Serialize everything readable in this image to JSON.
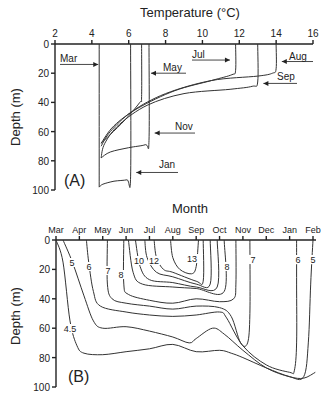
{
  "chart_data": [
    {
      "panel": "A",
      "type": "line",
      "title": "Temperature (°C)",
      "xlabel": "Temperature (°C)",
      "ylabel": "Depth (m)",
      "xlim": [
        2,
        16
      ],
      "ylim": [
        0,
        100
      ],
      "x_ticks": [
        2,
        4,
        6,
        8,
        10,
        12,
        14,
        16
      ],
      "y_ticks": [
        0,
        20,
        40,
        60,
        80,
        100
      ],
      "y_inverted": true,
      "x_axis_position": "top",
      "panel_label": "(A)",
      "series": [
        {
          "name": "Mar",
          "points": [
            [
              4.4,
              0
            ],
            [
              4.4,
              98
            ]
          ]
        },
        {
          "name": "May",
          "points": [
            [
              6.7,
              0
            ],
            [
              6.7,
              36
            ],
            [
              6.6,
              40
            ],
            [
              5.8,
              52
            ],
            [
              5.0,
              62
            ],
            [
              4.5,
              68
            ]
          ]
        },
        {
          "name": "Jul",
          "points": [
            [
              11.8,
              0
            ],
            [
              11.8,
              18
            ],
            [
              11.6,
              21
            ],
            [
              10.5,
              25
            ],
            [
              8.5,
              32
            ],
            [
              6.5,
              44
            ],
            [
              5.2,
              56
            ],
            [
              4.5,
              68
            ]
          ]
        },
        {
          "name": "Aug",
          "points": [
            [
              14.0,
              0
            ],
            [
              14.0,
              17
            ],
            [
              13.8,
              20
            ],
            [
              13.0,
              22
            ],
            [
              10.5,
              25
            ],
            [
              8.0,
              34
            ],
            [
              6.2,
              46
            ],
            [
              5.0,
              60
            ],
            [
              4.5,
              70
            ]
          ]
        },
        {
          "name": "Sep",
          "points": [
            [
              13.0,
              0
            ],
            [
              13.0,
              26
            ],
            [
              12.7,
              29
            ],
            [
              11.5,
              31
            ],
            [
              9.0,
              34
            ],
            [
              7.0,
              42
            ],
            [
              5.5,
              55
            ],
            [
              4.7,
              68
            ],
            [
              4.5,
              78
            ]
          ]
        },
        {
          "name": "Nov",
          "points": [
            [
              7.1,
              0
            ],
            [
              7.1,
              66
            ],
            [
              6.9,
              69
            ],
            [
              6.0,
              71
            ],
            [
              5.0,
              74
            ],
            [
              4.5,
              78
            ]
          ]
        },
        {
          "name": "Jan",
          "points": [
            [
              6.1,
              0
            ],
            [
              6.1,
              91
            ],
            [
              5.9,
              93
            ],
            [
              5.2,
              94
            ],
            [
              4.6,
              96
            ],
            [
              4.4,
              98
            ]
          ]
        }
      ],
      "annotations": [
        {
          "text": "Mar",
          "arrow_to": [
            4.4,
            14
          ]
        },
        {
          "text": "May",
          "arrow_to": [
            7.1,
            20
          ]
        },
        {
          "text": "Jul",
          "arrow_to": [
            11.6,
            11
          ]
        },
        {
          "text": "Aug",
          "arrow_to": [
            14.2,
            12
          ]
        },
        {
          "text": "Sep",
          "arrow_to": [
            13.2,
            27
          ]
        },
        {
          "text": "Nov",
          "arrow_to": [
            7.3,
            61
          ]
        },
        {
          "text": "Jan",
          "arrow_to": [
            6.3,
            88
          ]
        }
      ]
    },
    {
      "panel": "B",
      "type": "line",
      "title": "Month",
      "xlabel": "Month",
      "ylabel": "Depth (m)",
      "categories": [
        "Mar",
        "Apr",
        "May",
        "Jun",
        "Jul",
        "Aug",
        "Sep",
        "Oct",
        "Nov",
        "Dec",
        "Jan",
        "Feb"
      ],
      "ylim": [
        0,
        100
      ],
      "y_ticks": [
        0,
        20,
        40,
        60,
        80,
        100
      ],
      "y_inverted": true,
      "x_axis_position": "top",
      "panel_label": "(B)",
      "isotherm_labels": [
        "4.5",
        "5",
        "6",
        "7",
        "8",
        "10",
        "12",
        "13",
        "8",
        "7",
        "6",
        "5"
      ],
      "series": [
        {
          "name": "4.5",
          "points": [
            [
              0.0,
              0
            ],
            [
              0.3,
              15
            ],
            [
              0.6,
              55
            ],
            [
              0.9,
              72
            ],
            [
              1.2,
              77
            ],
            [
              2,
              78
            ],
            [
              3,
              76
            ],
            [
              4,
              74
            ],
            [
              5,
              71
            ],
            [
              6,
              76
            ],
            [
              7,
              75
            ],
            [
              7.5,
              77
            ],
            [
              8,
              80
            ],
            [
              9,
              87
            ],
            [
              10,
              93
            ],
            [
              10.6,
              94
            ],
            [
              11.1,
              90
            ]
          ]
        },
        {
          "name": "5",
          "points": [
            [
              0.3,
              0
            ],
            [
              0.7,
              15
            ],
            [
              1.2,
              38
            ],
            [
              1.6,
              55
            ],
            [
              2,
              60
            ],
            [
              3,
              59
            ],
            [
              4,
              62
            ],
            [
              5,
              66
            ],
            [
              5.7,
              70
            ],
            [
              6,
              67
            ],
            [
              6.7,
              60
            ],
            [
              7.2,
              64
            ],
            [
              8,
              75
            ],
            [
              9,
              87
            ],
            [
              10,
              93
            ],
            [
              10.6,
              93
            ],
            [
              10.8,
              70
            ],
            [
              10.9,
              30
            ],
            [
              11,
              0
            ]
          ]
        },
        {
          "name": "6",
          "points": [
            [
              1.3,
              0
            ],
            [
              1.4,
              15
            ],
            [
              1.6,
              35
            ],
            [
              1.9,
              45
            ],
            [
              3,
              49
            ],
            [
              4,
              51
            ],
            [
              5,
              52
            ],
            [
              6,
              51
            ],
            [
              7,
              49
            ],
            [
              7.3,
              53
            ],
            [
              8,
              72
            ],
            [
              9,
              85
            ],
            [
              10,
              90
            ],
            [
              10.2,
              89
            ],
            [
              10.3,
              70
            ],
            [
              10.3,
              30
            ],
            [
              10.3,
              0
            ]
          ]
        },
        {
          "name": "7",
          "points": [
            [
              2.2,
              0
            ],
            [
              2.2,
              30
            ],
            [
              2.4,
              40
            ],
            [
              3,
              43
            ],
            [
              4,
              45
            ],
            [
              5,
              47
            ],
            [
              6,
              45
            ],
            [
              7,
              46
            ],
            [
              7.5,
              52
            ],
            [
              7.9,
              70
            ],
            [
              8.2,
              70
            ],
            [
              8.3,
              50
            ],
            [
              8.3,
              0
            ]
          ]
        },
        {
          "name": "8",
          "points": [
            [
              2.9,
              0
            ],
            [
              2.9,
              30
            ],
            [
              3.1,
              37
            ],
            [
              4,
              41
            ],
            [
              5,
              43
            ],
            [
              6,
              40
            ],
            [
              7,
              42
            ],
            [
              7.6,
              40
            ],
            [
              7.7,
              30
            ],
            [
              7.7,
              0
            ]
          ]
        },
        {
          "name": "10",
          "points": [
            [
              3.1,
              0
            ],
            [
              3.3,
              22
            ],
            [
              3.7,
              30
            ],
            [
              5,
              32
            ],
            [
              6,
              33
            ],
            [
              7.2,
              35
            ],
            [
              7.2,
              0
            ]
          ]
        },
        {
          "name": "10b",
          "points": [
            [
              3.4,
              0
            ],
            [
              3.6,
              18
            ],
            [
              4,
              27
            ],
            [
              5,
              29
            ],
            [
              6,
              32
            ],
            [
              6.9,
              32
            ],
            [
              6.9,
              0
            ]
          ]
        },
        {
          "name": "12",
          "points": [
            [
              3.8,
              0
            ],
            [
              3.9,
              12
            ],
            [
              4.3,
              22
            ],
            [
              5,
              25
            ],
            [
              6,
              30
            ],
            [
              6.6,
              30
            ],
            [
              6.6,
              0
            ]
          ]
        },
        {
          "name": "12b",
          "points": [
            [
              4.2,
              0
            ],
            [
              4.3,
              12
            ],
            [
              4.6,
              20
            ],
            [
              5,
              22
            ],
            [
              6,
              28
            ],
            [
              6.3,
              28
            ],
            [
              6.3,
              0
            ]
          ]
        },
        {
          "name": "13",
          "points": [
            [
              4.9,
              0
            ],
            [
              5,
              12
            ],
            [
              5.3,
              20
            ],
            [
              5.8,
              23
            ],
            [
              6.0,
              18
            ],
            [
              6.1,
              0
            ]
          ]
        }
      ]
    }
  ],
  "panel_a": {
    "axis_title": "Temperature (°C)",
    "y_title": "Depth (m)",
    "label": "(A)",
    "x_tick_labels": [
      "2",
      "4",
      "6",
      "8",
      "10",
      "12",
      "14",
      "16"
    ],
    "y_tick_labels": [
      "0",
      "20",
      "40",
      "60",
      "80",
      "100"
    ],
    "month_labels": {
      "mar": "Mar",
      "may": "May",
      "jul": "Jul",
      "aug": "Aug",
      "sep": "Sep",
      "nov": "Nov",
      "jan": "Jan"
    }
  },
  "panel_b": {
    "axis_title": "Month",
    "y_title": "Depth (m)",
    "label": "(B)",
    "x_tick_labels": [
      "Mar",
      "Apr",
      "May",
      "Jun",
      "Jul",
      "Aug",
      "Sep",
      "Oct",
      "Nov",
      "Dec",
      "Jan",
      "Feb"
    ],
    "y_tick_labels": [
      "0",
      "20",
      "40",
      "60",
      "80",
      "100"
    ],
    "contour_labels": {
      "l45": "4.5",
      "l5": "5",
      "l6": "6",
      "l7": "7",
      "l8": "8",
      "l10": "10",
      "l12": "12",
      "l13": "13",
      "r8": "8",
      "r7": "7",
      "r6": "6",
      "r5": "5"
    }
  }
}
